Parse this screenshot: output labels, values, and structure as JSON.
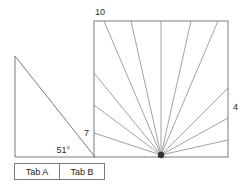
{
  "canvas": {
    "width": 248,
    "height": 186,
    "background": "#ffffff"
  },
  "colors": {
    "stroke": "#7a7a7a",
    "ray": "#8a8a8a",
    "hub": "#333333",
    "text": "#2b2b2b"
  },
  "labels": {
    "top_left": "10",
    "right": "4",
    "mid_left": "7",
    "angle": "51°"
  },
  "triangle": {
    "name": "right-triangle",
    "apex": {
      "x": 15,
      "y": 56
    },
    "bottom_left": {
      "x": 15,
      "y": 157
    },
    "bottom_right": {
      "x": 95,
      "y": 157
    },
    "angle_label": "51°"
  },
  "square": {
    "name": "fan-square",
    "left": 94,
    "top": 21,
    "right": 228,
    "bottom": 157,
    "hub": {
      "x": 161,
      "y": 155
    },
    "rays_top_x": [
      104,
      131,
      161,
      191,
      218
    ],
    "rays_left_y": [
      73,
      105,
      133
    ],
    "rays_right_y": [
      88,
      118,
      140
    ]
  },
  "tabs": [
    {
      "label": "Tab A",
      "selected": false
    },
    {
      "label": "Tab B",
      "selected": false
    }
  ]
}
